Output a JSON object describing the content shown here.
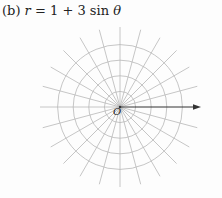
{
  "title": {
    "label": "(b)",
    "equation_lhs": "r",
    "equation_eq": " = 1 + 3 sin ",
    "equation_theta": "θ"
  },
  "diagram": {
    "type": "polar-grid",
    "origin_label": "O",
    "circle_count": 4,
    "radial_line_count": 24,
    "angle_step_degrees": 15,
    "axis": "polar axis arrow pointing right",
    "grid_color": "#b8b8b8",
    "axis_color": "#333333"
  }
}
